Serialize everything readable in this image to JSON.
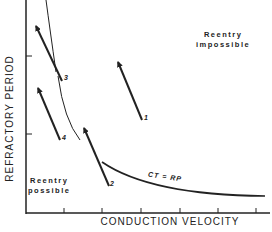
{
  "figure": {
    "xlabel": "CONDUCTION VELOCITY",
    "ylabel": "REFRACTORY PERIOD",
    "regions": {
      "impossible_line1": "Reentry",
      "impossible_line2": "impossible",
      "possible_line1": "Reentry",
      "possible_line2": "possible"
    },
    "curve_label": "CT = RP",
    "arrows": [
      {
        "id": "1",
        "label": "1"
      },
      {
        "id": "2",
        "label": "2"
      },
      {
        "id": "3",
        "label": "3"
      },
      {
        "id": "4",
        "label": "4"
      }
    ],
    "colors": {
      "ink": "#222222",
      "background": "#ffffff"
    }
  }
}
